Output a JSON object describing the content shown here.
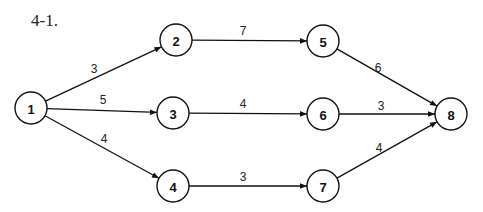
{
  "title": "4-1.",
  "nodes": [
    {
      "id": "1",
      "label": "1",
      "x": 31,
      "y": 108
    },
    {
      "id": "2",
      "label": "2",
      "x": 176,
      "y": 40
    },
    {
      "id": "3",
      "label": "3",
      "x": 173,
      "y": 113
    },
    {
      "id": "4",
      "label": "4",
      "x": 173,
      "y": 186
    },
    {
      "id": "5",
      "label": "5",
      "x": 323,
      "y": 41
    },
    {
      "id": "6",
      "label": "6",
      "x": 323,
      "y": 114
    },
    {
      "id": "7",
      "label": "7",
      "x": 323,
      "y": 186
    },
    {
      "id": "8",
      "label": "8",
      "x": 451,
      "y": 114
    }
  ],
  "edges": [
    {
      "from": "1",
      "to": "2",
      "weight": "3",
      "lx": 94,
      "ly": 73
    },
    {
      "from": "1",
      "to": "3",
      "weight": "5",
      "lx": 103,
      "ly": 104
    },
    {
      "from": "1",
      "to": "4",
      "weight": "4",
      "lx": 104,
      "ly": 143
    },
    {
      "from": "2",
      "to": "5",
      "weight": "7",
      "lx": 243,
      "ly": 35
    },
    {
      "from": "3",
      "to": "6",
      "weight": "4",
      "lx": 243,
      "ly": 108
    },
    {
      "from": "4",
      "to": "7",
      "weight": "3",
      "lx": 243,
      "ly": 181
    },
    {
      "from": "5",
      "to": "8",
      "weight": "6",
      "lx": 378,
      "ly": 72
    },
    {
      "from": "6",
      "to": "8",
      "weight": "3",
      "lx": 381,
      "ly": 110
    },
    {
      "from": "7",
      "to": "8",
      "weight": "4",
      "lx": 379,
      "ly": 152
    }
  ]
}
